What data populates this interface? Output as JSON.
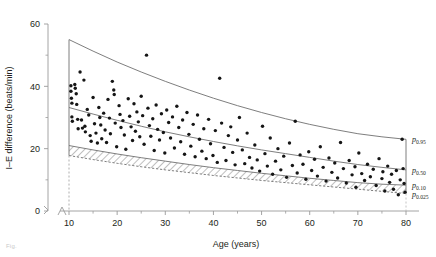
{
  "figure": {
    "caption_fragment": "Fig.",
    "background": "#ffffff",
    "ink": "#231f20"
  },
  "chart_data": {
    "type": "scatter",
    "title": "",
    "xlabel": "Age (years)",
    "ylabel": "I–E difference (beats/min)",
    "xlim": [
      10,
      80
    ],
    "ylim": [
      0,
      60
    ],
    "xticks": [
      10,
      20,
      30,
      40,
      50,
      60,
      70,
      80
    ],
    "yticks": [
      0,
      20,
      40,
      60
    ],
    "xminor_step": 5,
    "yminor_step": 10,
    "grid": false,
    "legend": "none",
    "axis_break": true,
    "axis_break_note": "both axes broken near origin; dashed vertical reference at age 10",
    "marker": {
      "shape": "circle",
      "color": "#151515",
      "size_px": 3.4
    },
    "curve_color": "#6f6f6f",
    "hatch_band_color": "#7a7a7a",
    "annotations": [
      {
        "text": "p",
        "sub": "0.95",
        "x": 80,
        "y": 23.0
      },
      {
        "text": "p",
        "sub": "0.50",
        "x": 80,
        "y": 13.2
      },
      {
        "text": "p",
        "sub": "0.10",
        "x": 80,
        "y": 8.3
      },
      {
        "text": "p",
        "sub": "0.025",
        "x": 80,
        "y": 5.6
      }
    ],
    "series": [
      {
        "name": "p0.95",
        "kind": "line",
        "style": "solid",
        "x": [
          10,
          15,
          20,
          25,
          30,
          35,
          40,
          45,
          50,
          55,
          60,
          65,
          70,
          75,
          80
        ],
        "values": [
          55.0,
          51.3,
          47.8,
          44.6,
          41.6,
          38.8,
          36.2,
          33.8,
          31.6,
          29.6,
          27.8,
          26.2,
          24.8,
          23.8,
          23.0
        ]
      },
      {
        "name": "p0.50",
        "kind": "line",
        "style": "solid",
        "x": [
          10,
          15,
          20,
          25,
          30,
          35,
          40,
          45,
          50,
          55,
          60,
          65,
          70,
          75,
          80
        ],
        "values": [
          33.2,
          31.1,
          29.1,
          27.2,
          25.4,
          23.8,
          22.3,
          20.9,
          19.6,
          18.4,
          17.2,
          16.0,
          14.9,
          14.0,
          13.2
        ]
      },
      {
        "name": "p0.10",
        "kind": "line",
        "style": "solid",
        "x": [
          10,
          15,
          20,
          25,
          30,
          35,
          40,
          45,
          50,
          55,
          60,
          65,
          70,
          75,
          80
        ],
        "values": [
          21.0,
          19.6,
          18.3,
          17.1,
          16.0,
          14.9,
          13.9,
          13.0,
          12.1,
          11.3,
          10.5,
          9.8,
          9.1,
          8.6,
          8.3
        ]
      },
      {
        "name": "p0.025",
        "kind": "line",
        "style": "dashed",
        "x": [
          10,
          15,
          20,
          25,
          30,
          35,
          40,
          45,
          50,
          55,
          60,
          65,
          70,
          75,
          80
        ],
        "values": [
          17.8,
          16.5,
          15.3,
          14.2,
          13.2,
          12.3,
          11.4,
          10.6,
          9.8,
          9.1,
          8.4,
          7.7,
          7.0,
          6.3,
          5.6
        ]
      },
      {
        "name": "subjects",
        "kind": "points",
        "points": [
          [
            10.4,
            40.2
          ],
          [
            10.4,
            38.4
          ],
          [
            10.5,
            36.2
          ],
          [
            10.6,
            34.6
          ],
          [
            10.6,
            30.2
          ],
          [
            10.7,
            28.8
          ],
          [
            11.2,
            40.6
          ],
          [
            11.3,
            39.4
          ],
          [
            11.5,
            37.6
          ],
          [
            11.6,
            34.2
          ],
          [
            11.8,
            29.4
          ],
          [
            11.9,
            26.4
          ],
          [
            12.3,
            44.6
          ],
          [
            12.6,
            29.2
          ],
          [
            12.8,
            26.6
          ],
          [
            13.1,
            42.0
          ],
          [
            13.3,
            27.2
          ],
          [
            13.4,
            25.4
          ],
          [
            13.8,
            32.6
          ],
          [
            14.1,
            30.8
          ],
          [
            14.4,
            24.2
          ],
          [
            14.6,
            22.4
          ],
          [
            15.0,
            36.4
          ],
          [
            15.3,
            28.0
          ],
          [
            15.6,
            25.0
          ],
          [
            15.9,
            21.8
          ],
          [
            16.2,
            33.2
          ],
          [
            16.4,
            30.0
          ],
          [
            16.6,
            27.6
          ],
          [
            16.8,
            23.2
          ],
          [
            17.2,
            31.4
          ],
          [
            17.5,
            26.0
          ],
          [
            17.8,
            22.0
          ],
          [
            18.1,
            35.8
          ],
          [
            18.4,
            29.8
          ],
          [
            18.6,
            24.8
          ],
          [
            19.0,
            41.6
          ],
          [
            19.3,
            38.8
          ],
          [
            19.4,
            37.4
          ],
          [
            19.6,
            28.2
          ],
          [
            19.9,
            20.6
          ],
          [
            20.4,
            33.8
          ],
          [
            20.6,
            31.0
          ],
          [
            20.8,
            26.8
          ],
          [
            21.2,
            29.0
          ],
          [
            21.5,
            24.4
          ],
          [
            21.8,
            19.8
          ],
          [
            22.3,
            36.0
          ],
          [
            22.6,
            30.4
          ],
          [
            22.9,
            27.0
          ],
          [
            23.2,
            22.6
          ],
          [
            23.5,
            34.4
          ],
          [
            23.8,
            25.6
          ],
          [
            24.1,
            31.8
          ],
          [
            24.4,
            28.6
          ],
          [
            24.7,
            23.8
          ],
          [
            25.0,
            36.8
          ],
          [
            25.3,
            30.6
          ],
          [
            25.6,
            21.4
          ],
          [
            26.1,
            50.0
          ],
          [
            26.4,
            33.0
          ],
          [
            26.7,
            27.4
          ],
          [
            27.0,
            24.0
          ],
          [
            27.4,
            29.6
          ],
          [
            27.7,
            19.4
          ],
          [
            28.1,
            34.0
          ],
          [
            28.4,
            26.2
          ],
          [
            28.8,
            22.8
          ],
          [
            29.2,
            31.2
          ],
          [
            29.6,
            25.2
          ],
          [
            29.9,
            18.6
          ],
          [
            30.3,
            32.4
          ],
          [
            30.7,
            28.4
          ],
          [
            31.1,
            23.4
          ],
          [
            31.5,
            30.2
          ],
          [
            31.9,
            20.2
          ],
          [
            32.4,
            33.6
          ],
          [
            32.8,
            26.8
          ],
          [
            33.2,
            22.2
          ],
          [
            33.6,
            29.2
          ],
          [
            34.0,
            18.2
          ],
          [
            34.5,
            31.6
          ],
          [
            34.9,
            24.6
          ],
          [
            35.3,
            20.8
          ],
          [
            35.8,
            27.8
          ],
          [
            36.2,
            17.4
          ],
          [
            36.7,
            30.8
          ],
          [
            37.1,
            23.0
          ],
          [
            37.6,
            19.2
          ],
          [
            38.0,
            26.4
          ],
          [
            38.5,
            16.8
          ],
          [
            39.0,
            29.4
          ],
          [
            39.4,
            21.6
          ],
          [
            39.9,
            17.8
          ],
          [
            40.4,
            25.8
          ],
          [
            40.8,
            15.6
          ],
          [
            41.3,
            42.6
          ],
          [
            41.7,
            28.2
          ],
          [
            42.2,
            20.4
          ],
          [
            42.6,
            16.2
          ],
          [
            43.1,
            24.2
          ],
          [
            43.6,
            27.0
          ],
          [
            44.0,
            18.8
          ],
          [
            44.5,
            14.8
          ],
          [
            45.0,
            22.8
          ],
          [
            45.4,
            30.0
          ],
          [
            46.0,
            19.6
          ],
          [
            46.5,
            15.2
          ],
          [
            47.0,
            25.0
          ],
          [
            47.5,
            17.2
          ],
          [
            48.0,
            13.8
          ],
          [
            48.6,
            21.2
          ],
          [
            49.1,
            16.4
          ],
          [
            49.6,
            12.8
          ],
          [
            50.2,
            27.2
          ],
          [
            50.7,
            18.4
          ],
          [
            51.2,
            14.4
          ],
          [
            51.8,
            23.4
          ],
          [
            52.3,
            11.8
          ],
          [
            52.9,
            16.0
          ],
          [
            53.4,
            20.0
          ],
          [
            54.0,
            13.2
          ],
          [
            54.6,
            17.6
          ],
          [
            55.2,
            10.8
          ],
          [
            55.8,
            21.8
          ],
          [
            56.4,
            14.6
          ],
          [
            57.0,
            28.8
          ],
          [
            57.4,
            12.2
          ],
          [
            58.0,
            18.0
          ],
          [
            58.6,
            15.0
          ],
          [
            59.2,
            10.2
          ],
          [
            59.8,
            19.0
          ],
          [
            60.4,
            13.0
          ],
          [
            61.0,
            16.6
          ],
          [
            61.6,
            11.2
          ],
          [
            62.2,
            20.6
          ],
          [
            62.8,
            14.0
          ],
          [
            63.4,
            9.6
          ],
          [
            64.0,
            17.0
          ],
          [
            64.6,
            12.4
          ],
          [
            65.2,
            15.4
          ],
          [
            65.8,
            10.6
          ],
          [
            66.4,
            22.0
          ],
          [
            67.0,
            13.6
          ],
          [
            67.6,
            9.0
          ],
          [
            68.2,
            16.2
          ],
          [
            68.8,
            11.6
          ],
          [
            69.4,
            14.2
          ],
          [
            69.6,
            7.6
          ],
          [
            70.2,
            18.6
          ],
          [
            70.8,
            12.0
          ],
          [
            71.4,
            9.8
          ],
          [
            72.0,
            15.0
          ],
          [
            72.6,
            11.0
          ],
          [
            73.2,
            13.4
          ],
          [
            73.8,
            8.2
          ],
          [
            74.4,
            16.8
          ],
          [
            75.0,
            10.4
          ],
          [
            75.2,
            12.6
          ],
          [
            75.6,
            6.4
          ],
          [
            76.2,
            14.4
          ],
          [
            76.6,
            9.2
          ],
          [
            77.0,
            11.8
          ],
          [
            77.4,
            7.0
          ],
          [
            78.0,
            13.0
          ],
          [
            78.4,
            5.2
          ],
          [
            78.8,
            10.0
          ],
          [
            79.2,
            23.0
          ],
          [
            79.4,
            13.6
          ],
          [
            79.6,
            8.8
          ],
          [
            79.8,
            6.0
          ]
        ]
      }
    ]
  }
}
